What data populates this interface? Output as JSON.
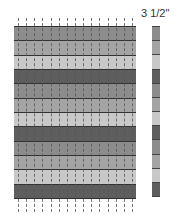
{
  "diagram": {
    "label": "3 1/2\"",
    "stitch_line_count": 15,
    "bands": [
      {
        "shade": "medium",
        "color": "#8c8c8c"
      },
      {
        "shade": "medium-light",
        "color": "#a4a4a4"
      },
      {
        "shade": "light",
        "color": "#c8c8c8"
      },
      {
        "shade": "dark",
        "color": "#5e5e5e"
      },
      {
        "shade": "medium",
        "color": "#8c8c8c"
      },
      {
        "shade": "medium-light",
        "color": "#a4a4a4"
      },
      {
        "shade": "light",
        "color": "#c8c8c8"
      },
      {
        "shade": "dark",
        "color": "#5e5e5e"
      },
      {
        "shade": "medium",
        "color": "#8c8c8c"
      },
      {
        "shade": "medium-light",
        "color": "#a4a4a4"
      },
      {
        "shade": "light",
        "color": "#c8c8c8"
      },
      {
        "shade": "dark",
        "color": "#5e5e5e"
      }
    ]
  }
}
